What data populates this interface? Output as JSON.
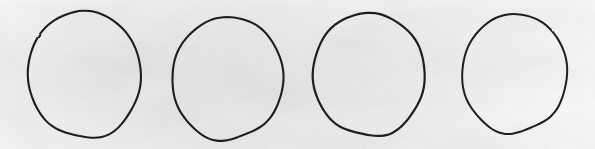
{
  "document": {
    "kind": "scanned-paper-sheet",
    "caption": "Four hand-drawn circles on textured off-white paper",
    "width": 595,
    "height": 149,
    "background_color": "#f6f6f4",
    "paper_tint_color": "#e8e8e6",
    "ink_color": "#201f1f",
    "shape_count": 4
  },
  "shapes": [
    {
      "index": 1,
      "name": "circle-one",
      "label": "Circle 1",
      "cx": 84.5,
      "cy": 74.5,
      "rx": 56.5,
      "ry": 63.5,
      "bbox": {
        "left": 28,
        "top": 11,
        "right": 141,
        "bottom": 138,
        "width": 113,
        "height": 127
      },
      "stroke_width": 2.1,
      "rotation": -2,
      "wobble": [
        1.2,
        -1.0,
        0.9,
        -1.3,
        0.7,
        -0.8
      ]
    },
    {
      "index": 2,
      "name": "circle-two",
      "label": "Circle 2",
      "cx": 227.5,
      "cy": 78.5,
      "rx": 55.5,
      "ry": 61.5,
      "bbox": {
        "left": 172,
        "top": 17,
        "right": 283,
        "bottom": 140,
        "width": 111,
        "height": 123
      },
      "stroke_width": 2.1,
      "rotation": 3,
      "wobble": [
        -0.9,
        1.1,
        -1.2,
        0.8,
        -0.7,
        1.0
      ]
    },
    {
      "index": 3,
      "name": "circle-three",
      "label": "Circle 3",
      "cx": 369,
      "cy": 74.5,
      "rx": 56,
      "ry": 61.5,
      "bbox": {
        "left": 313,
        "top": 13,
        "right": 425,
        "bottom": 136,
        "width": 112,
        "height": 123
      },
      "stroke_width": 2.2,
      "rotation": -1,
      "wobble": [
        1.0,
        -0.8,
        1.3,
        -0.9,
        0.6,
        -1.1
      ]
    },
    {
      "index": 4,
      "name": "circle-four",
      "label": "Circle 4",
      "cx": 514.5,
      "cy": 73.5,
      "rx": 52.5,
      "ry": 59.5,
      "bbox": {
        "left": 462,
        "top": 14,
        "right": 567,
        "bottom": 133,
        "width": 105,
        "height": 119
      },
      "stroke_width": 2.0,
      "rotation": 2,
      "wobble": [
        -1.1,
        0.9,
        -0.7,
        1.2,
        -1.0,
        0.8
      ]
    }
  ]
}
